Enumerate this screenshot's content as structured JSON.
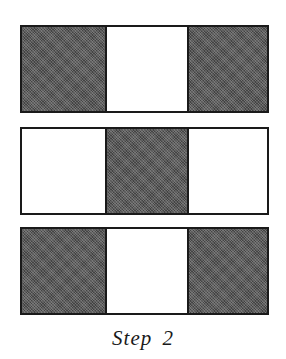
{
  "diagram": {
    "caption": "Step 2",
    "colors": {
      "shaded": "#5a5a5a",
      "white": "#ffffff",
      "border": "#1a1a1a"
    },
    "rows": [
      {
        "cells": [
          "shaded",
          "white",
          "shaded"
        ]
      },
      {
        "cells": [
          "white",
          "shaded",
          "white"
        ]
      },
      {
        "cells": [
          "shaded",
          "white",
          "shaded"
        ]
      }
    ]
  }
}
